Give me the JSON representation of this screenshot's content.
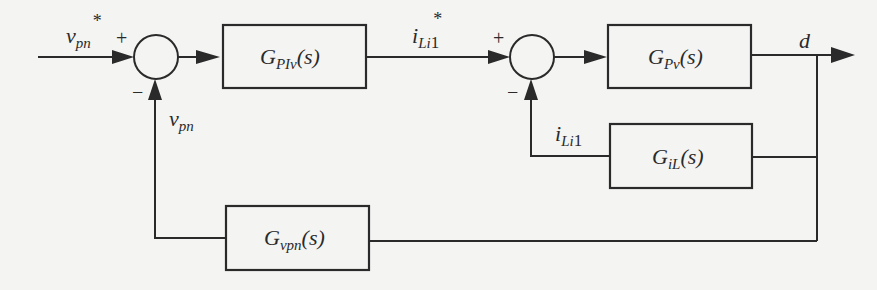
{
  "diagram": {
    "type": "control-block-diagram",
    "signals": {
      "input_ref": {
        "base": "v",
        "sub": "pn",
        "sup": "*"
      },
      "feedback_v": {
        "base": "v",
        "sub": "pn"
      },
      "current_ref": {
        "base": "i",
        "sub": "Li",
        "tail": "1",
        "sup": "*"
      },
      "feedback_i": {
        "base": "i",
        "sub": "Li",
        "tail": "1"
      },
      "output": {
        "base": "d"
      }
    },
    "summing_junctions": [
      {
        "id": "sum1",
        "plus": "+",
        "minus": "−"
      },
      {
        "id": "sum2",
        "plus": "+",
        "minus": "−"
      }
    ],
    "blocks": {
      "gpiv": {
        "base": "G",
        "sub": "PIv",
        "arg": "(s)"
      },
      "gpv": {
        "base": "G",
        "sub": "Pv",
        "arg": "(s)"
      },
      "gil": {
        "base": "G",
        "sub": "iL",
        "arg": "(s)"
      },
      "gvpn": {
        "base": "G",
        "sub": "vpn",
        "arg": "(s)"
      }
    }
  }
}
